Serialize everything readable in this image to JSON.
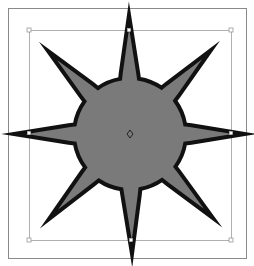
{
  "canvas": {
    "width": 254,
    "height": 266,
    "background": "#ffffff"
  },
  "frame": {
    "x": 8,
    "y": 8,
    "width": 238,
    "height": 250,
    "stroke": "#8a8a8a"
  },
  "selection_box": {
    "x": 29,
    "y": 30,
    "width": 202,
    "height": 210,
    "stroke": "#b0b0b0"
  },
  "handles": [
    {
      "name": "corner-top-left",
      "x": 29,
      "y": 30
    },
    {
      "name": "corner-top-right",
      "x": 231,
      "y": 30
    },
    {
      "name": "corner-bottom-left",
      "x": 29,
      "y": 240
    },
    {
      "name": "corner-bottom-right",
      "x": 231,
      "y": 240
    }
  ],
  "anchor_points": [
    {
      "name": "top",
      "x": 129,
      "y": 30
    },
    {
      "name": "bottom",
      "x": 131,
      "y": 240
    },
    {
      "name": "left",
      "x": 29,
      "y": 133
    },
    {
      "name": "right",
      "x": 231,
      "y": 133
    }
  ],
  "star": {
    "center": {
      "x": 130,
      "y": 134
    },
    "points": 8,
    "fill": "#7a7a7a",
    "stroke": "#111111",
    "stroke_width": 4,
    "tips": [
      {
        "dir": "n",
        "x": 129,
        "y": 15
      },
      {
        "dir": "ne",
        "x": 211,
        "y": 50
      },
      {
        "dir": "e",
        "x": 245,
        "y": 134
      },
      {
        "dir": "se",
        "x": 213,
        "y": 218
      },
      {
        "dir": "s",
        "x": 132,
        "y": 254
      },
      {
        "dir": "sw",
        "x": 49,
        "y": 219
      },
      {
        "dir": "w",
        "x": 14,
        "y": 134
      },
      {
        "dir": "nw",
        "x": 48,
        "y": 51
      }
    ]
  },
  "center_marker": {
    "x": 130,
    "y": 134,
    "icon": "diamond-center-point"
  }
}
